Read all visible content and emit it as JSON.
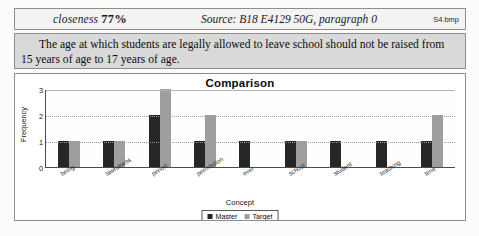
{
  "header": {
    "closeness_label": "closeness",
    "closeness_value": "77%",
    "source": "Source: B18 E4129 50G, paragraph 0",
    "filename": "S4.bmp"
  },
  "paragraph": {
    "text": "The age at which students are legally allowed to leave school should not be raised from 15 years of age to 17 years of age."
  },
  "chart_data": {
    "type": "bar",
    "title": "Comparison",
    "xlabel": "Concept",
    "ylabel": "Frequency",
    "ylim": [
      0,
      3
    ],
    "yticks": [
      "3",
      "2",
      "1",
      "0"
    ],
    "grid": true,
    "legend_position": "bottom",
    "categories": [
      "being",
      "lawfulness",
      "period",
      "permission",
      "ever",
      "school",
      "student",
      "teaching",
      "time"
    ],
    "series": [
      {
        "name": "Master",
        "color": "#262626",
        "values": [
          1,
          1,
          2,
          1,
          1,
          1,
          1,
          1,
          1
        ]
      },
      {
        "name": "Target",
        "color": "#9e9e9e",
        "values": [
          1,
          1,
          3,
          2,
          0,
          1,
          0,
          0,
          2
        ]
      }
    ]
  },
  "colors": {
    "master": "#262626",
    "target": "#9e9e9e",
    "paragraph_bg": "#d9d9d9",
    "header_bg": "#f4f3f1",
    "border": "#8d8d8d"
  }
}
